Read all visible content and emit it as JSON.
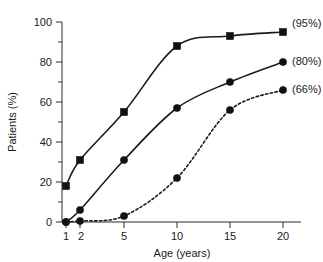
{
  "chart_data": {
    "type": "line",
    "title": "",
    "subtitle": "",
    "xlabel": "Age (years)",
    "ylabel": "Patients (%)",
    "x": [
      1,
      2,
      5,
      10,
      15,
      20
    ],
    "xtick_labels": [
      "1",
      "2",
      "5",
      "10",
      "15",
      "20"
    ],
    "ytick_labels": [
      "0",
      "20",
      "40",
      "60",
      "80",
      "100"
    ],
    "yticks": [
      0,
      20,
      40,
      60,
      80,
      100
    ],
    "ylim": [
      0,
      100
    ],
    "xlim_labels": [
      "1",
      "20"
    ],
    "x_scale": "ordinal-nonlinear",
    "grid": false,
    "legend_position": "right-inline-end-of-line",
    "y_minor_ticks": [
      10,
      30,
      50,
      70,
      90
    ],
    "series": [
      {
        "name": "(95%)",
        "label": "(95%)",
        "marker": "square",
        "linestyle": "solid",
        "color": "#111111",
        "values": [
          18,
          31,
          55,
          88,
          93,
          95
        ],
        "end_label": "(95%)"
      },
      {
        "name": "(80%)",
        "label": "(80%)",
        "marker": "circle",
        "linestyle": "solid",
        "color": "#111111",
        "values": [
          0,
          6,
          31,
          57,
          70,
          80
        ],
        "end_label": "(80%)"
      },
      {
        "name": "(66%)",
        "label": "(66%)",
        "marker": "circle",
        "linestyle": "dashed",
        "color": "#111111",
        "values": [
          0,
          0.5,
          3,
          22,
          56,
          66
        ],
        "end_label": "(66%)"
      }
    ]
  },
  "labels": {
    "series_95": "(95%)",
    "series_80": "(80%)",
    "series_66": "(66%)"
  }
}
